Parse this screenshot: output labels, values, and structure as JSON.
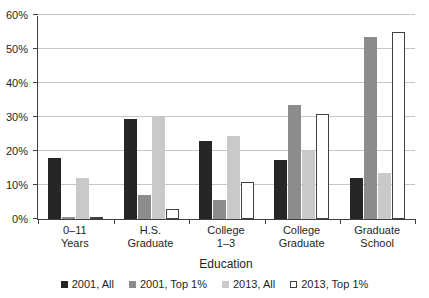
{
  "chart_data": {
    "type": "bar",
    "title": "",
    "categories": [
      "0–11 Years",
      "H.S. Graduate",
      "College 1–3",
      "College Graduate",
      "Graduate School"
    ],
    "categories_multiline": [
      "0–11\nYears",
      "H.S.\nGraduate",
      "College\n1–3",
      "College\nGraduate",
      "Graduate\nSchool"
    ],
    "series": [
      {
        "name": "2001, All",
        "color": "#262626",
        "values": [
          18,
          29.5,
          23,
          17.5,
          12
        ]
      },
      {
        "name": "2001, Top 1%",
        "color": "#8c8c8c",
        "values": [
          0.5,
          7,
          5.5,
          33.5,
          53.5
        ]
      },
      {
        "name": "2013, All",
        "color": "#c9c9c9",
        "values": [
          12,
          30,
          24.5,
          20,
          13.5
        ]
      },
      {
        "name": "2013, Top 1%",
        "color": "#ffffff",
        "border_color": "#404040",
        "values": [
          0.5,
          3,
          11,
          31,
          55
        ]
      }
    ],
    "xlabel": "Education",
    "ylabel": "",
    "ylim": [
      0,
      60
    ],
    "ytick_step": 10,
    "ytick_labels": [
      "0%",
      "10%",
      "20%",
      "30%",
      "40%",
      "50%",
      "60%"
    ],
    "grid": true,
    "legend_position": "bottom",
    "colors": {
      "axis": "#404040",
      "gridline": "#c6c6c6",
      "text": "#1f1f1f"
    }
  }
}
